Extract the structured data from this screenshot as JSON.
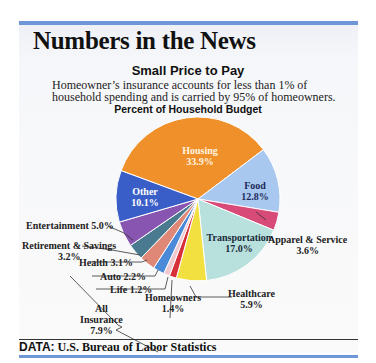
{
  "header": {
    "title": "Numbers in the News",
    "subtitle": "Small Price to Pay",
    "description": "Homeowner’s insurance accounts for less than 1% of household spending and is carried by 95% of homeowners."
  },
  "chart_data": {
    "type": "pie",
    "title": "Percent of Household Budget",
    "categories": [
      "Housing",
      "Food",
      "Apparel & Service",
      "Transportation",
      "Healthcare",
      "Homeowners",
      "Life",
      "Auto",
      "Health",
      "Retirement & Savings",
      "Entertainment",
      "Other"
    ],
    "values": [
      33.9,
      12.8,
      3.6,
      17.0,
      5.9,
      1.4,
      1.2,
      2.2,
      3.1,
      3.2,
      5.0,
      10.1
    ],
    "colors": [
      "#f0902a",
      "#a8c8f0",
      "#d84a78",
      "#b8e0dc",
      "#f2e040",
      "#d8303a",
      "#f0c8d0",
      "#4a8ad8",
      "#e08878",
      "#4a7a90",
      "#8855b0",
      "#3a5ec8"
    ],
    "group": {
      "label": "All Insurance",
      "value": 7.9,
      "members": [
        "Homeowners",
        "Life",
        "Auto",
        "Health"
      ]
    },
    "legend": "none"
  },
  "labels": {
    "housing": {
      "name": "Housing",
      "value": "33.9%"
    },
    "food": {
      "name": "Food",
      "value": "12.8%"
    },
    "other": {
      "name": "Other",
      "value": "10.1%"
    },
    "transportation": {
      "name": "Transportation",
      "value": "17.0%"
    },
    "apparel": {
      "name": "Apparel & Service",
      "value": "3.6%"
    },
    "healthcare": {
      "name": "Healthcare",
      "value": "5.9%"
    },
    "homeowners": {
      "name": "Homeowners",
      "value": "1.4%"
    },
    "life": "Life 1.2%",
    "auto": "Auto 2.2%",
    "health": "Health 3.1%",
    "retirement": {
      "name": "Retirement & Savings",
      "value": "3.2%"
    },
    "entertainment": "Entertainment 5.0%",
    "insurance": {
      "line1": "All",
      "line2": "Insurance",
      "value": "7.9%"
    }
  },
  "footer": {
    "key": "DATA:",
    "source": "U.S. Bureau of Labor Statistics"
  }
}
